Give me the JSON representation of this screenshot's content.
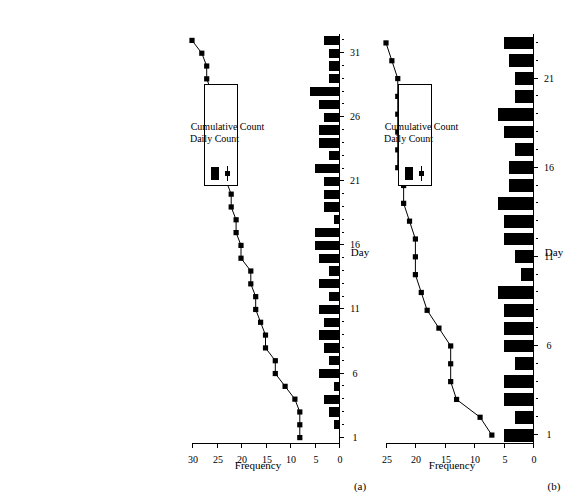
{
  "figure": {
    "orientation": "rotated-90-ccw",
    "background": "#ffffff",
    "ink": "#000000"
  },
  "panels": [
    {
      "tag": "(a)",
      "legend": {
        "bar_label": "Daily Count",
        "line_label": "Cumulative Count"
      }
    },
    {
      "tag": "(b)",
      "legend": {
        "bar_label": "Daily Count",
        "line_label": "Cumulative Count"
      }
    }
  ],
  "chart_data": [
    {
      "type": "bar",
      "panel": "(a)",
      "title": "",
      "xlabel": "Day",
      "ylabel": "Frequency",
      "xlim": [
        0.5,
        32.5
      ],
      "ylim": [
        0,
        30
      ],
      "xticks": [
        1,
        6,
        11,
        16,
        21,
        26,
        31
      ],
      "yticks": [
        0,
        5,
        10,
        15,
        20,
        25,
        30
      ],
      "grid": false,
      "legend_position": "upper-left",
      "x": [
        1,
        2,
        3,
        4,
        5,
        6,
        7,
        8,
        9,
        10,
        11,
        12,
        13,
        14,
        15,
        16,
        17,
        18,
        19,
        20,
        21,
        22,
        23,
        24,
        25,
        26,
        27,
        28,
        29,
        30,
        31,
        32
      ],
      "series": [
        {
          "name": "Daily Count",
          "kind": "bar",
          "values": [
            0,
            1,
            2,
            3,
            1,
            4,
            2,
            3,
            4,
            3,
            4,
            2,
            4,
            2,
            4,
            5,
            5,
            1,
            3,
            3,
            3,
            5,
            2,
            4,
            4,
            3,
            4,
            6,
            2,
            2,
            2,
            3
          ]
        },
        {
          "name": "Cumulative Count",
          "kind": "line",
          "marker": "square",
          "values": [
            8,
            8,
            8,
            9,
            11,
            13,
            13,
            15,
            15,
            16,
            17,
            17,
            18,
            18,
            20,
            20,
            21,
            21,
            22,
            22,
            23,
            24,
            24,
            25,
            25,
            25,
            26,
            26,
            27,
            27,
            28,
            30
          ]
        }
      ]
    },
    {
      "type": "bar",
      "panel": "(b)",
      "title": "",
      "xlabel": "Day",
      "ylabel": "Frequency",
      "xlim": [
        0.5,
        23.5
      ],
      "ylim": [
        0,
        25
      ],
      "xticks": [
        1,
        6,
        11,
        16,
        21
      ],
      "yticks": [
        0,
        5,
        10,
        15,
        20,
        25
      ],
      "grid": false,
      "legend_position": "upper-left",
      "x": [
        1,
        2,
        3,
        4,
        5,
        6,
        7,
        8,
        9,
        10,
        11,
        12,
        13,
        14,
        15,
        16,
        17,
        18,
        19,
        20,
        21,
        22,
        23
      ],
      "series": [
        {
          "name": "Daily Count",
          "kind": "bar",
          "values": [
            5,
            3,
            5,
            5,
            3,
            5,
            5,
            5,
            6,
            2,
            3,
            5,
            5,
            6,
            4,
            4,
            3,
            5,
            6,
            3,
            3,
            4,
            5
          ]
        },
        {
          "name": "Cumulative Count",
          "kind": "line",
          "marker": "square",
          "values": [
            7,
            9,
            13,
            14,
            14,
            14,
            16,
            18,
            19,
            20,
            20,
            20,
            21,
            22,
            22,
            23,
            23,
            23,
            23,
            23,
            23,
            24,
            25
          ]
        }
      ]
    }
  ]
}
